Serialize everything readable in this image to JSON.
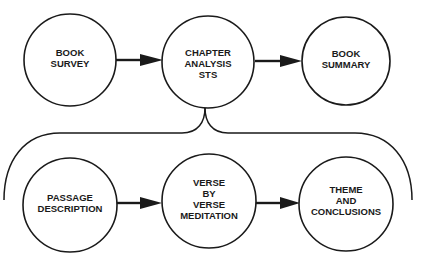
{
  "diagram": {
    "type": "flow",
    "colors": {
      "stroke": "#1a1a1a",
      "background": "#ffffff",
      "text": "#1a1a1a"
    },
    "top_row": [
      {
        "id": "book-survey",
        "lines": [
          "BOOK",
          "SURVEY"
        ]
      },
      {
        "id": "chapter-analysis",
        "lines": [
          "CHAPTER",
          "ANALYSIS",
          "STS"
        ]
      },
      {
        "id": "book-summary",
        "lines": [
          "BOOK",
          "SUMMARY"
        ]
      }
    ],
    "bottom_row": [
      {
        "id": "passage-description",
        "lines": [
          "PASSAGE",
          "DESCRIPTION"
        ]
      },
      {
        "id": "verse-by-verse",
        "lines": [
          "VERSE",
          "BY",
          "VERSE",
          "MEDITATION"
        ]
      },
      {
        "id": "theme-conclusions",
        "lines": [
          "THEME",
          "AND",
          "CONCLUSIONS"
        ]
      }
    ],
    "edges": [
      {
        "from": "book-survey",
        "to": "chapter-analysis",
        "type": "arrow"
      },
      {
        "from": "chapter-analysis",
        "to": "book-summary",
        "type": "arrow"
      },
      {
        "from": "passage-description",
        "to": "verse-by-verse",
        "type": "arrow"
      },
      {
        "from": "verse-by-verse",
        "to": "theme-conclusions",
        "type": "arrow"
      },
      {
        "from": "chapter-analysis",
        "to": "bottom_row",
        "type": "brace-expansion"
      }
    ]
  }
}
